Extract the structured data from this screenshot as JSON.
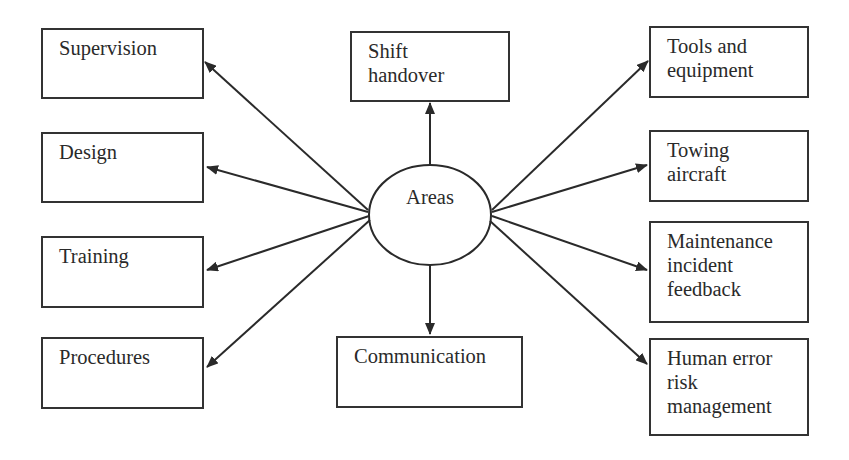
{
  "diagram": {
    "type": "hub-and-spoke",
    "center": {
      "label": "Areas"
    },
    "nodes": [
      {
        "id": "supervision",
        "lines": [
          "Supervision"
        ]
      },
      {
        "id": "design",
        "lines": [
          "Design"
        ]
      },
      {
        "id": "training",
        "lines": [
          "Training"
        ]
      },
      {
        "id": "procedures",
        "lines": [
          "Procedures"
        ]
      },
      {
        "id": "shift-handover",
        "lines": [
          "Shift",
          "handover"
        ]
      },
      {
        "id": "communication",
        "lines": [
          "Communication"
        ]
      },
      {
        "id": "tools-and-equipment",
        "lines": [
          "Tools and",
          "equipment"
        ]
      },
      {
        "id": "towing-aircraft",
        "lines": [
          "Towing",
          "aircraft"
        ]
      },
      {
        "id": "maintenance-incident-feedback",
        "lines": [
          "Maintenance",
          "incident",
          "feedback"
        ]
      },
      {
        "id": "human-error-risk-management",
        "lines": [
          "Human error",
          "risk",
          "management"
        ]
      }
    ],
    "edges": [
      {
        "from": "Areas",
        "to": "Supervision"
      },
      {
        "from": "Areas",
        "to": "Design"
      },
      {
        "from": "Areas",
        "to": "Training"
      },
      {
        "from": "Areas",
        "to": "Procedures"
      },
      {
        "from": "Areas",
        "to": "Shift handover"
      },
      {
        "from": "Areas",
        "to": "Communication"
      },
      {
        "from": "Areas",
        "to": "Tools and equipment"
      },
      {
        "from": "Areas",
        "to": "Towing aircraft"
      },
      {
        "from": "Areas",
        "to": "Maintenance incident feedback"
      },
      {
        "from": "Areas",
        "to": "Human error risk management"
      }
    ],
    "colors": {
      "line": "#2a2a2a",
      "background": "#ffffff",
      "text": "#2a2a2a"
    }
  }
}
